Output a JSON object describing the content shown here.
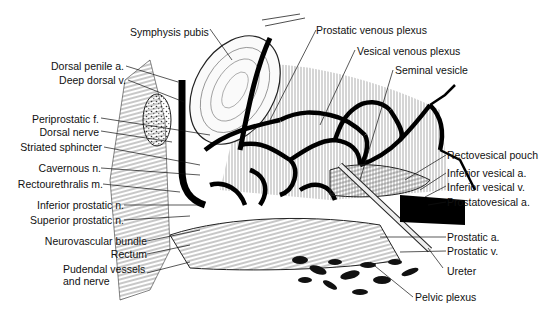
{
  "figure": {
    "labels_left": [
      {
        "id": "dorsal-penile-a",
        "text": "Dorsal penile a."
      },
      {
        "id": "deep-dorsal-v",
        "text": "Deep dorsal v."
      },
      {
        "id": "periprostatic-f",
        "text": "Periprostatic f."
      },
      {
        "id": "dorsal-nerve",
        "text": "Dorsal nerve"
      },
      {
        "id": "striated-sphincter",
        "text": "Striated sphincter"
      },
      {
        "id": "cavernous-n",
        "text": "Cavernous n."
      },
      {
        "id": "rectourethralis-m",
        "text": "Rectourethralis m."
      },
      {
        "id": "inferior-prostatic-n",
        "text": "Inferior prostatic n."
      },
      {
        "id": "superior-prostatic-n",
        "text": "Superior prostatic n."
      },
      {
        "id": "neurovascular-bundle",
        "text": "Neurovascular bundle"
      },
      {
        "id": "rectum",
        "text": "Rectum"
      },
      {
        "id": "pudendal-vessels-1",
        "text": "Pudendal vessels"
      },
      {
        "id": "pudendal-vessels-2",
        "text": "and nerve"
      }
    ],
    "labels_top": [
      {
        "id": "symphysis-pubis",
        "text": "Symphysis pubis"
      },
      {
        "id": "prostatic-venous-plexus",
        "text": "Prostatic venous plexus"
      },
      {
        "id": "vesical-venous-plexus",
        "text": "Vesical venous plexus"
      },
      {
        "id": "seminal-vesicle",
        "text": "Seminal vesicle"
      }
    ],
    "labels_right": [
      {
        "id": "rectovesical-pouch",
        "text": "Rectovesical pouch"
      },
      {
        "id": "inferior-vesical-a",
        "text": "Inferior vesical a."
      },
      {
        "id": "inferior-vesical-v",
        "text": "Inferior vesical v."
      },
      {
        "id": "prostatovesical-a",
        "text": "Prostatovesical a."
      },
      {
        "id": "prostatic-a",
        "text": "Prostatic a."
      },
      {
        "id": "prostatic-v",
        "text": "Prostatic v."
      },
      {
        "id": "ureter",
        "text": "Ureter"
      },
      {
        "id": "pelvic-plexus",
        "text": "Pelvic plexus"
      }
    ],
    "colors": {
      "ink": "#111111",
      "background": "#ffffff",
      "hatch": "#555555"
    }
  }
}
